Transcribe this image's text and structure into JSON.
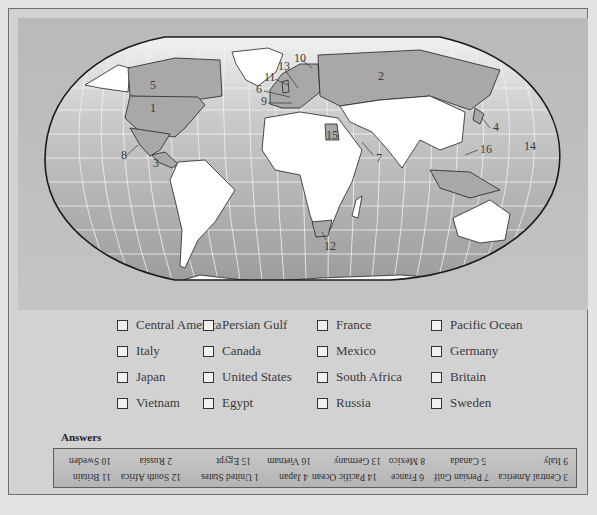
{
  "map": {
    "title": "World political map quiz",
    "labels": [
      {
        "num": "1",
        "x": 150,
        "y": 112
      },
      {
        "num": "2",
        "x": 378,
        "y": 80
      },
      {
        "num": "3",
        "x": 153,
        "y": 167
      },
      {
        "num": "4",
        "x": 493,
        "y": 131
      },
      {
        "num": "5",
        "x": 150,
        "y": 89
      },
      {
        "num": "6",
        "x": 256,
        "y": 93
      },
      {
        "num": "7",
        "x": 376,
        "y": 162
      },
      {
        "num": "8",
        "x": 121,
        "y": 159
      },
      {
        "num": "9",
        "x": 261,
        "y": 105
      },
      {
        "num": "10",
        "x": 294,
        "y": 62
      },
      {
        "num": "11",
        "x": 264,
        "y": 81
      },
      {
        "num": "12",
        "x": 324,
        "y": 250
      },
      {
        "num": "13",
        "x": 278,
        "y": 70
      },
      {
        "num": "14",
        "x": 524,
        "y": 150
      },
      {
        "num": "15",
        "x": 326,
        "y": 139
      },
      {
        "num": "16",
        "x": 480,
        "y": 153
      }
    ],
    "colors": {
      "ocean": "#b3b3b3",
      "land": "#ffffff",
      "highlight": "#a8a8a8",
      "border": "#222222"
    }
  },
  "checklist": {
    "columns": [
      [
        "Central America",
        "Italy",
        "Japan",
        "Vietnam"
      ],
      [
        "Persian Gulf",
        "Canada",
        "United States",
        "Egypt"
      ],
      [
        "France",
        "Mexico",
        "South Africa",
        "Russia"
      ],
      [
        "Pacific Ocean",
        "Germany",
        "Britain",
        "Sweden"
      ]
    ]
  },
  "answers": {
    "title": "Answers",
    "row1": [
      "3 Central America",
      "7 Persian Gulf",
      "6 France",
      "14 Pacific Ocean",
      "4 Japan",
      "1 United States",
      "12 South Africa",
      "11 Britain"
    ],
    "row2": [
      "9 Italy",
      "5 Canada",
      "8 Mexico",
      "13 Germany",
      "16 Vietnam",
      "15 Egypt",
      "2 Russia",
      "10 Sweden"
    ]
  }
}
